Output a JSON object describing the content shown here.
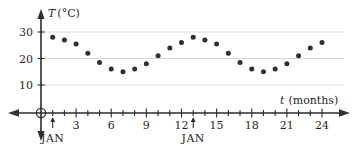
{
  "figure": {
    "title": "",
    "y_axis_label": "T (°C)",
    "y_axis_symbol": "T",
    "y_axis_unit": "(°C)",
    "x_axis_label": "t (months)",
    "x_axis_symbol": "t",
    "x_axis_unit": "(months)",
    "origin_marker": "circle",
    "background_color": "#ffffff",
    "point_color": "#2e2e33",
    "grid_color": "#d9d9d9",
    "axis_color": "#2b2b2b"
  },
  "annotations": [
    {
      "label": "JAN",
      "t": 1,
      "marker": "up-arrow"
    },
    {
      "label": "JAN",
      "t": 13,
      "marker": "up-arrow"
    }
  ],
  "chart_data": {
    "type": "scatter",
    "title": "",
    "xlabel": "t (months)",
    "ylabel": "T (°C)",
    "xlim": [
      0,
      25.5
    ],
    "ylim": [
      0,
      33
    ],
    "grid": true,
    "gridlines_y": [
      10,
      20,
      30
    ],
    "legend": null,
    "xticks": [
      0,
      1,
      2,
      3,
      4,
      5,
      6,
      7,
      8,
      9,
      10,
      11,
      12,
      13,
      14,
      15,
      16,
      17,
      18,
      19,
      20,
      21,
      22,
      23,
      24
    ],
    "xticklabels": [
      "",
      "",
      "",
      "3",
      "",
      "",
      "6",
      "",
      "",
      "9",
      "",
      "",
      "12",
      "",
      "",
      "15",
      "",
      "",
      "18",
      "",
      "",
      "21",
      "",
      "",
      "24"
    ],
    "yticks": [
      10,
      20,
      30
    ],
    "yticklabels": [
      "10",
      "20",
      "30"
    ],
    "x": [
      1,
      2,
      3,
      4,
      5,
      6,
      7,
      8,
      9,
      10,
      11,
      12,
      13,
      14,
      15,
      16,
      17,
      18,
      19,
      20,
      21,
      22,
      23,
      24
    ],
    "values": [
      28,
      27,
      25.5,
      22,
      18.5,
      16,
      15,
      16,
      18,
      21,
      24,
      26,
      28,
      27,
      25.5,
      22,
      18.5,
      16,
      15,
      16,
      18,
      21,
      24,
      26
    ],
    "point_labels": []
  }
}
